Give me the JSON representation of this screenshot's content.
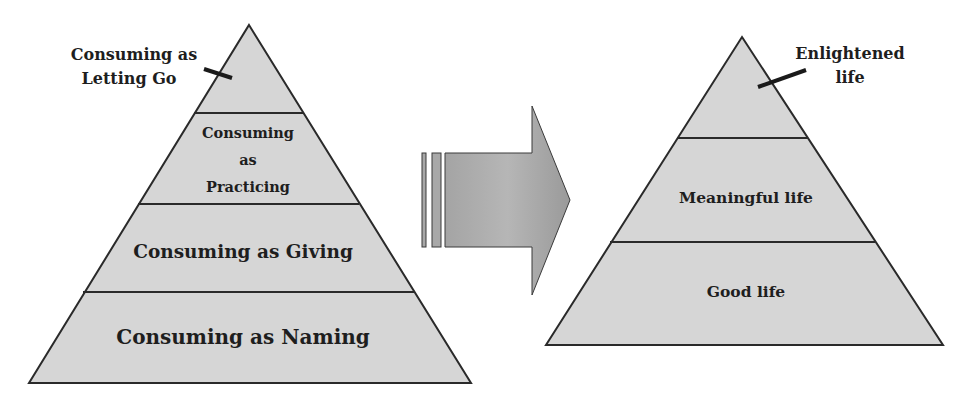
{
  "colors": {
    "pyramid_fill": "#d6d6d6",
    "outline": "#2a2a2a",
    "arrow_fill_light": "#b8b8b8",
    "arrow_fill_dark": "#8e8e8e",
    "text": "#1e1e1e"
  },
  "left_pyramid": {
    "callout": {
      "line1": "Consuming as",
      "line2": "Letting Go"
    },
    "levels": [
      {
        "lines": [
          "Consuming",
          "as",
          "Practicing"
        ]
      },
      {
        "label": "Consuming as Giving"
      },
      {
        "label": "Consuming as Naming"
      }
    ]
  },
  "arrow": {
    "direction": "right"
  },
  "right_pyramid": {
    "callout": {
      "line1": "Enlightened",
      "line2": "life"
    },
    "levels": [
      {
        "label": "Meaningful life"
      },
      {
        "label": "Good life"
      }
    ]
  }
}
